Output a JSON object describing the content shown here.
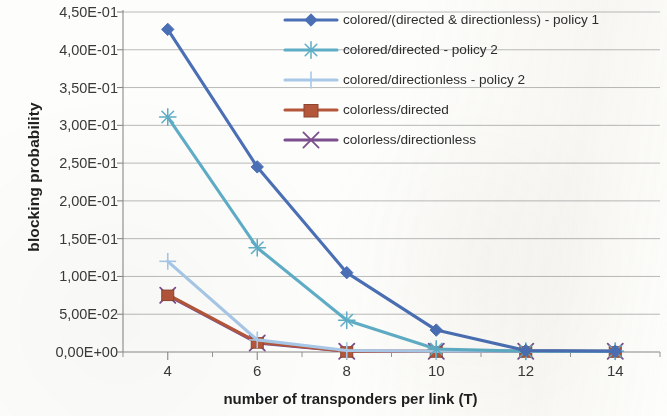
{
  "chart_data": {
    "type": "line",
    "title": "",
    "xlabel": "number of transponders per link (T)",
    "ylabel": "blocking probability",
    "x": [
      4,
      6,
      8,
      10,
      12,
      14
    ],
    "xtick_labels": [
      "4",
      "6",
      "8",
      "10",
      "12",
      "14"
    ],
    "ytick_labels": [
      "4,50E-01",
      "4,00E-01",
      "3,50E-01",
      "3,00E-01",
      "2,50E-01",
      "2,00E-01",
      "1,50E-01",
      "1,00E-01",
      "5,00E-02",
      "0,00E+00"
    ],
    "ytick_values": [
      0.45,
      0.4,
      0.35,
      0.3,
      0.25,
      0.2,
      0.15,
      0.1,
      0.05,
      0.0
    ],
    "ylim": [
      0.0,
      0.45
    ],
    "xlim": [
      3,
      15
    ],
    "grid": "horizontal",
    "legend_position": "top-right-inside",
    "series": [
      {
        "name": "colored/(directed & directionless) - policy 1",
        "color": "#4a6fb5",
        "marker": "diamond",
        "values": [
          0.427,
          0.245,
          0.105,
          0.029,
          0.002,
          0.001
        ]
      },
      {
        "name": "colored/directed - policy 2",
        "color": "#5eadc6",
        "marker": "star",
        "values": [
          0.311,
          0.138,
          0.042,
          0.004,
          0.001,
          0.001
        ]
      },
      {
        "name": "colored/directionless - policy 2",
        "color": "#a8c8e8",
        "marker": "plus",
        "values": [
          0.12,
          0.016,
          0.002,
          0.001,
          0.001,
          0.001
        ]
      },
      {
        "name": "colorless/directed",
        "color": "#b4563a",
        "marker": "square",
        "values": [
          0.076,
          0.013,
          0.001,
          0.001,
          0.001,
          0.001
        ]
      },
      {
        "name": "colorless/directionless",
        "color": "#7b4f8e",
        "marker": "cross",
        "values": [
          0.075,
          0.012,
          0.001,
          0.001,
          0.001,
          0.001
        ]
      }
    ]
  }
}
